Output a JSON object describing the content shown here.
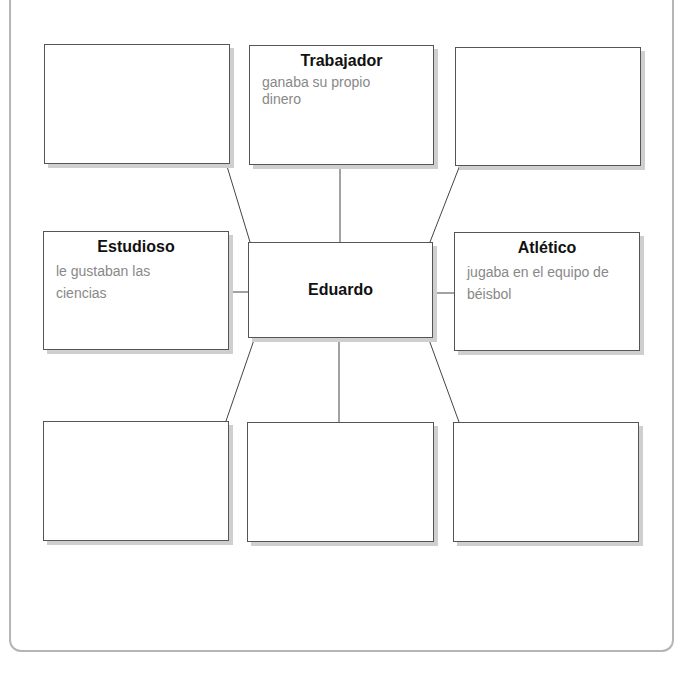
{
  "diagram": {
    "center": {
      "title": "Eduardo"
    },
    "nodes": [
      {
        "position": "top-left",
        "title": "",
        "description": ""
      },
      {
        "position": "top-center",
        "title": "Trabajador",
        "description": "ganaba su propio dinero"
      },
      {
        "position": "top-right",
        "title": "",
        "description": ""
      },
      {
        "position": "middle-left",
        "title": "Estudioso",
        "description": "le gustaban las ciencias"
      },
      {
        "position": "middle-right",
        "title": "Atlético",
        "description": "jugaba en el equipo de béisbol"
      },
      {
        "position": "bottom-left",
        "title": "",
        "description": ""
      },
      {
        "position": "bottom-center",
        "title": "",
        "description": ""
      },
      {
        "position": "bottom-right",
        "title": "",
        "description": ""
      }
    ]
  }
}
